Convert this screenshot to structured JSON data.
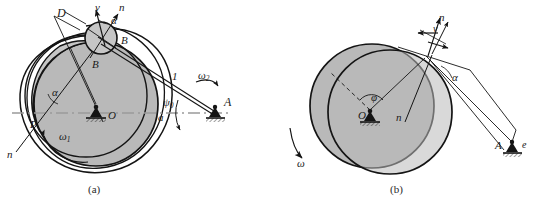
{
  "figure": {
    "title_caption_a": "(a)",
    "title_caption_b": "(b)",
    "type": "mechanism-kinematics-diagram",
    "colors": {
      "outline": "#141414",
      "fill_gray": "#b9b9b9",
      "fill_gray_light": "#c6c6c6",
      "centerline": "#9a9a9a",
      "background": "#ffffff"
    }
  },
  "panel_a": {
    "caption": "(a)",
    "labels": {
      "point_D": "D",
      "velocity_v": "v",
      "normal_n_top": "n",
      "alpha_top": "α",
      "point_B_roller": "B",
      "point_B_cam": "B",
      "alpha_left": "α",
      "point_P": "P",
      "normal_n_left": "n",
      "omega_1": "ω",
      "omega_1_sub": "1",
      "omega_2": "ω",
      "omega_2_sub": "2",
      "link_1": "1",
      "psi_0": "ψ",
      "psi_0_sub": "0",
      "center_O": "O",
      "distance_a": "a",
      "point_A": "A"
    }
  },
  "panel_b": {
    "caption": "(b)",
    "labels": {
      "normal_n_top": "n",
      "velocity_v": "v",
      "alpha_contact": "α",
      "phi": "φ",
      "center_O": "O",
      "normal_n_mid": "n",
      "omega": "ω",
      "point_A": "A",
      "eccentricity_e": "e"
    }
  }
}
